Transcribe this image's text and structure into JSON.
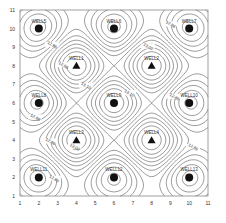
{
  "chart_data": {
    "type": "contour",
    "title": "",
    "xlabel": "",
    "ylabel": "",
    "xlim": [
      1,
      11
    ],
    "ylim": [
      1,
      11
    ],
    "x_ticks": [
      "1",
      "2",
      "3",
      "4",
      "5",
      "6",
      "7",
      "8",
      "9",
      "10",
      "11"
    ],
    "y_ticks": [
      "1",
      "2",
      "3",
      "4",
      "5",
      "6",
      "7",
      "8",
      "9",
      "10",
      "11"
    ],
    "grid": false,
    "legend": null,
    "contour_labels": [
      {
        "text": "12.86",
        "x": 2.7,
        "y": 9.1
      },
      {
        "text": "12.86",
        "x": 3.3,
        "y": 8.0
      },
      {
        "text": "13.10",
        "x": 4.5,
        "y": 6.9
      },
      {
        "text": "13.00",
        "x": 7.8,
        "y": 9.0
      },
      {
        "text": "12.86",
        "x": 9.0,
        "y": 10.2
      },
      {
        "text": "13.10",
        "x": 6.8,
        "y": 6.5
      },
      {
        "text": "12.86",
        "x": 9.2,
        "y": 6.3
      },
      {
        "text": "12.86",
        "x": 1.8,
        "y": 5.2
      },
      {
        "text": "12.86",
        "x": 2.6,
        "y": 3.9
      },
      {
        "text": "13.00",
        "x": 3.9,
        "y": 3.6
      },
      {
        "text": "12.86",
        "x": 2.8,
        "y": 1.9
      },
      {
        "text": "12.86",
        "x": 10.2,
        "y": 3.6
      }
    ],
    "wells": [
      {
        "name": "WELL5",
        "x": 2,
        "y": 10,
        "marker": "circle"
      },
      {
        "name": "WELL6",
        "x": 6,
        "y": 10,
        "marker": "circle"
      },
      {
        "name": "WELL7",
        "x": 10,
        "y": 10,
        "marker": "circle"
      },
      {
        "name": "WELL1",
        "x": 4,
        "y": 8,
        "marker": "triangle"
      },
      {
        "name": "WELL2",
        "x": 8,
        "y": 8,
        "marker": "triangle"
      },
      {
        "name": "WELL8",
        "x": 2,
        "y": 6,
        "marker": "circle"
      },
      {
        "name": "WELL9",
        "x": 6,
        "y": 6,
        "marker": "circle"
      },
      {
        "name": "WELL10",
        "x": 10,
        "y": 6,
        "marker": "circle"
      },
      {
        "name": "WELL3",
        "x": 4,
        "y": 4,
        "marker": "triangle"
      },
      {
        "name": "WELL4",
        "x": 8,
        "y": 4,
        "marker": "triangle"
      },
      {
        "name": "WELL11",
        "x": 2,
        "y": 2,
        "marker": "circle"
      },
      {
        "name": "WELL12",
        "x": 6,
        "y": 2,
        "marker": "circle"
      },
      {
        "name": "WELL13",
        "x": 10,
        "y": 2,
        "marker": "circle"
      }
    ],
    "colors": {
      "line": "#555555",
      "axis": "#888888",
      "marker": "#111111",
      "text": "#333333"
    }
  }
}
